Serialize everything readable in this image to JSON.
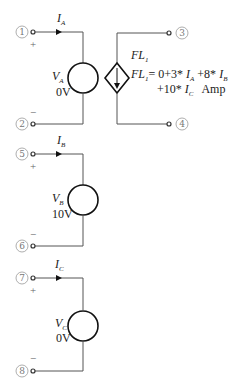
{
  "diagram": {
    "sources": [
      {
        "id": "A",
        "name": "V",
        "sub": "A",
        "value": "0V",
        "current": "I",
        "current_sub": "A",
        "pos_node": "1",
        "neg_node": "2"
      },
      {
        "id": "B",
        "name": "V",
        "sub": "B",
        "value": "10V",
        "current": "I",
        "current_sub": "B",
        "pos_node": "5",
        "neg_node": "6"
      },
      {
        "id": "C",
        "name": "V",
        "sub": "C",
        "value": "0V",
        "current": "I",
        "current_sub": "C",
        "pos_node": "7",
        "neg_node": "8"
      }
    ],
    "dependent_source": {
      "name": "FL",
      "sub": "1",
      "eq_lhs": "FL",
      "eq_lhs_sub": "1",
      "eq_line1": "= 0+3* ",
      "term_a": "I",
      "term_a_sub": "A",
      "eq_mid": " +8* ",
      "term_b": "I",
      "term_b_sub": "B",
      "eq_line2_pre": "+10* ",
      "term_c": "I",
      "term_c_sub": "C",
      "unit": "Amp",
      "top_node": "3",
      "bottom_node": "4"
    },
    "polarity": {
      "plus": "+",
      "minus": "−"
    },
    "colors": {
      "wire": "#555555",
      "source": "#111111",
      "text": "#222222"
    }
  }
}
